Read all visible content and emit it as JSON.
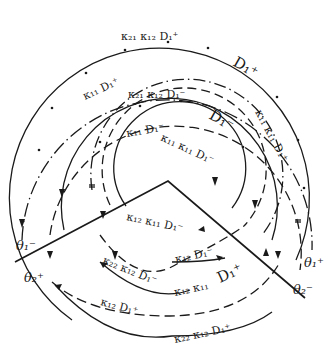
{
  "figure": {
    "colors": {
      "ink": "#1a1a1a",
      "background": "#ffffff"
    },
    "boundaries": {
      "left_upper": "θ₁⁻",
      "left_lower": "θ₂⁺",
      "right_upper": "θ₁⁺",
      "right_lower": "θ₂⁻"
    },
    "arc_labels": {
      "outer_top": "κ₂₁ κ₁₂ D₁⁺",
      "outer_dashed_left": "κ₁₁ D₁⁺",
      "outer_dashed_right": "D₁⁺",
      "middle_top": "κ₂₁ κ₁₂ D₁⁻",
      "middle_dashed_left": "κ₁₁ D₁⁻",
      "middle_dashed_right": "D₁⁻",
      "inner_top": "κ₁₁ κ₁₁ D₁⁻",
      "right_side": "κ₁₁ κ₁₁ D₁⁺",
      "inside_wedge": "κ₁₂ κ₁₁ D₁⁻",
      "lower_dashed_inner": "κ₁₂ D₁⁻",
      "lower_solid_inner": "κ₂₂ κ₁₂ D₁⁻",
      "lower_solid_inner_right": "κ₁₂ κ₁₁",
      "lower_D_right": "D₁⁺",
      "lower_dashed_outer": "κ₁₂ D₁⁺",
      "lower_solid_outer": "κ₂₂ κ₁₂ D₁⁺"
    }
  }
}
